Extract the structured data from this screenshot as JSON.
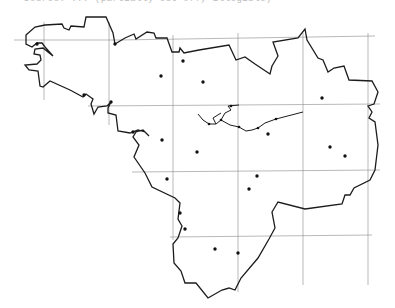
{
  "caption": "Source: ... (partially cut off, illegible)",
  "map": {
    "region": "Brittany (Bretagne) outline map",
    "grid": {
      "vertical_x": [
        44,
        109,
        173,
        238,
        303,
        368
      ],
      "horizontal_y": [
        40,
        106,
        172,
        237
      ]
    },
    "colors": {
      "outline": "#1c1c1c",
      "grid": "#8a8a8a",
      "background": "#ffffff",
      "points": "#111111"
    },
    "points": [
      {
        "x": 37,
        "y": 44
      },
      {
        "x": 115,
        "y": 44
      },
      {
        "x": 183,
        "y": 61
      },
      {
        "x": 161,
        "y": 76
      },
      {
        "x": 203,
        "y": 82
      },
      {
        "x": 84,
        "y": 95
      },
      {
        "x": 111,
        "y": 102
      },
      {
        "x": 322,
        "y": 98
      },
      {
        "x": 133,
        "y": 132
      },
      {
        "x": 162,
        "y": 140
      },
      {
        "x": 197,
        "y": 152
      },
      {
        "x": 268,
        "y": 134
      },
      {
        "x": 330,
        "y": 147
      },
      {
        "x": 345,
        "y": 156
      },
      {
        "x": 167,
        "y": 179
      },
      {
        "x": 257,
        "y": 176
      },
      {
        "x": 249,
        "y": 189
      },
      {
        "x": 180,
        "y": 213
      },
      {
        "x": 185,
        "y": 229
      },
      {
        "x": 215,
        "y": 249
      },
      {
        "x": 238,
        "y": 253
      }
    ]
  }
}
